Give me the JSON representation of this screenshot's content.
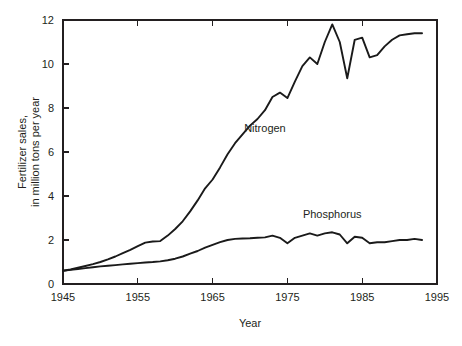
{
  "chart_data": {
    "type": "line",
    "title": "",
    "xlabel": "Year",
    "ylabel": "Fertilizer sales,\nin million tons per year",
    "ylabel_line1": "Fertilizer sales,",
    "ylabel_line2": "in million tons per year",
    "xlim": [
      1945,
      1995
    ],
    "ylim": [
      0,
      12
    ],
    "xticks": [
      1945,
      1955,
      1965,
      1975,
      1985,
      1995
    ],
    "xtick_labels": [
      "1945",
      "1955",
      "1965",
      "1975",
      "1985",
      "1995"
    ],
    "yticks": [
      0,
      2,
      4,
      6,
      8,
      10,
      12
    ],
    "ytick_labels": [
      "0",
      "2",
      "4",
      "6",
      "8",
      "10",
      "12"
    ],
    "grid": false,
    "legend_position": "inline-annotation",
    "line_color": "#1a1a1a",
    "axis_color": "#231f20",
    "background": "#ffffff",
    "series": [
      {
        "name": "Nitrogen",
        "label_x": 1972,
        "label_y": 6.9,
        "x": [
          1945,
          1946,
          1947,
          1948,
          1949,
          1950,
          1951,
          1952,
          1953,
          1954,
          1955,
          1956,
          1957,
          1958,
          1959,
          1960,
          1961,
          1962,
          1963,
          1964,
          1965,
          1966,
          1967,
          1968,
          1969,
          1970,
          1971,
          1972,
          1973,
          1974,
          1975,
          1976,
          1977,
          1978,
          1979,
          1980,
          1981,
          1982,
          1983,
          1984,
          1985,
          1986,
          1987,
          1988,
          1989,
          1990,
          1991,
          1992,
          1993
        ],
        "values": [
          0.6,
          0.66,
          0.74,
          0.82,
          0.9,
          1.0,
          1.12,
          1.25,
          1.4,
          1.55,
          1.72,
          1.88,
          1.93,
          1.95,
          2.2,
          2.5,
          2.85,
          3.3,
          3.8,
          4.35,
          4.75,
          5.3,
          5.9,
          6.4,
          6.8,
          7.2,
          7.5,
          7.9,
          8.5,
          8.7,
          8.45,
          9.2,
          9.9,
          10.3,
          10.0,
          11.0,
          11.8,
          11.0,
          9.35,
          11.1,
          11.2,
          10.3,
          10.4,
          10.8,
          11.1,
          11.3,
          11.35,
          11.4,
          11.4
        ]
      },
      {
        "name": "Phosphorus",
        "label_x": 1981,
        "label_y": 3.0,
        "x": [
          1945,
          1946,
          1947,
          1948,
          1949,
          1950,
          1951,
          1952,
          1953,
          1954,
          1955,
          1956,
          1957,
          1958,
          1959,
          1960,
          1961,
          1962,
          1963,
          1964,
          1965,
          1966,
          1967,
          1968,
          1969,
          1970,
          1971,
          1972,
          1973,
          1974,
          1975,
          1976,
          1977,
          1978,
          1979,
          1980,
          1981,
          1982,
          1983,
          1984,
          1985,
          1986,
          1987,
          1988,
          1989,
          1990,
          1991,
          1992,
          1993
        ],
        "values": [
          0.6,
          0.64,
          0.68,
          0.72,
          0.76,
          0.8,
          0.83,
          0.86,
          0.89,
          0.92,
          0.95,
          0.98,
          1.0,
          1.03,
          1.08,
          1.15,
          1.25,
          1.38,
          1.5,
          1.65,
          1.78,
          1.9,
          2.0,
          2.05,
          2.07,
          2.08,
          2.1,
          2.12,
          2.2,
          2.1,
          1.85,
          2.1,
          2.2,
          2.3,
          2.2,
          2.3,
          2.35,
          2.25,
          1.85,
          2.15,
          2.1,
          1.85,
          1.9,
          1.9,
          1.95,
          2.0,
          2.0,
          2.05,
          2.0
        ]
      }
    ]
  },
  "figure": {
    "plot_left": 63,
    "plot_right": 437,
    "plot_top": 20,
    "plot_bottom": 284
  }
}
